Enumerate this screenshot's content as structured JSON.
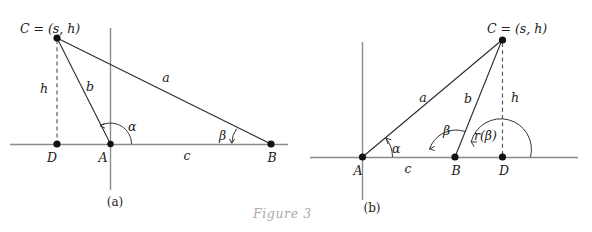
{
  "figure": {
    "caption": "Figure 3",
    "panels": [
      {
        "id": "a",
        "caption": "(a)",
        "vertex_label": "C = (s, h)",
        "points": [
          {
            "name": "C",
            "label": "C"
          },
          {
            "name": "D",
            "label": "D"
          },
          {
            "name": "A",
            "label": "A"
          },
          {
            "name": "B",
            "label": "B"
          }
        ],
        "segments": [
          {
            "name": "side-a",
            "label": "a"
          },
          {
            "name": "side-b",
            "label": "b"
          },
          {
            "name": "side-c",
            "label": "c"
          },
          {
            "name": "height-h",
            "label": "h"
          }
        ],
        "angles": [
          {
            "name": "alpha",
            "label": "α"
          },
          {
            "name": "beta",
            "label": "β"
          }
        ]
      },
      {
        "id": "b",
        "caption": "(b)",
        "vertex_label": "C = (s, h)",
        "points": [
          {
            "name": "A",
            "label": "A"
          },
          {
            "name": "B",
            "label": "B"
          },
          {
            "name": "D",
            "label": "D"
          },
          {
            "name": "C",
            "label": "C"
          }
        ],
        "segments": [
          {
            "name": "side-a",
            "label": "a"
          },
          {
            "name": "side-b",
            "label": "b"
          },
          {
            "name": "side-c",
            "label": "c"
          },
          {
            "name": "height-h",
            "label": "h"
          }
        ],
        "angles": [
          {
            "name": "alpha",
            "label": "α"
          },
          {
            "name": "beta",
            "label": "β"
          },
          {
            "name": "r-beta",
            "label": "r(β)"
          }
        ]
      }
    ]
  },
  "colors": {
    "axis": "#8a8a8a",
    "segment": "#2b2b2b",
    "dashed": "#5a5a5a",
    "point": "#111111",
    "text": "#1b1b1b",
    "figure_caption": "#a9a9a9",
    "background": "#ffffff"
  }
}
